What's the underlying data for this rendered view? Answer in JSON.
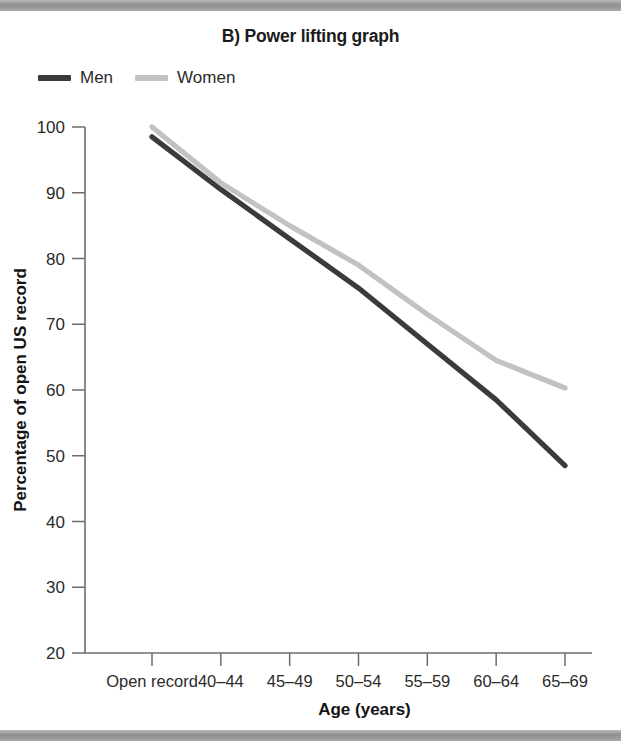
{
  "figure": {
    "panel_label": "B)",
    "title": "B) Power lifting graph"
  },
  "legend": {
    "position": "top-left",
    "entries": [
      {
        "name": "Men",
        "color": "#3b3b3b",
        "icon": "line-swatch-icon"
      },
      {
        "name": "Women",
        "color": "#c2c2c2",
        "icon": "line-swatch-icon"
      }
    ]
  },
  "axes": {
    "x_title": "Age (years)",
    "y_title": "Percentage of open US record",
    "y_ticks": [
      "100",
      "90",
      "80",
      "70",
      "60",
      "50",
      "40",
      "30",
      "20"
    ],
    "x_ticks": [
      "Open record",
      "40–44",
      "45–49",
      "50–54",
      "55–59",
      "60–64",
      "65–69"
    ]
  },
  "chart_data": {
    "type": "line",
    "title": "B) Power lifting graph",
    "xlabel": "Age (years)",
    "ylabel": "Percentage of open US record",
    "categories": [
      "Open record",
      "40–44",
      "45–49",
      "50–54",
      "55–59",
      "60–64",
      "65–69"
    ],
    "series": [
      {
        "name": "Men",
        "color": "#3b3b3b",
        "values": [
          98.5,
          90.5,
          83.0,
          75.5,
          67.0,
          58.5,
          48.5
        ]
      },
      {
        "name": "Women",
        "color": "#c2c2c2",
        "values": [
          100.0,
          91.5,
          85.0,
          79.0,
          71.5,
          64.5,
          60.3
        ]
      }
    ],
    "ylim": [
      20,
      100
    ],
    "ytick_step": 10,
    "grid": false,
    "legend_position": "top-left"
  },
  "style": {
    "band_color": "#9a9a9a",
    "axis_color": "#6d6d6d",
    "background": "#ffffff"
  }
}
